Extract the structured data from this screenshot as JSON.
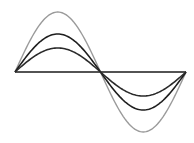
{
  "diagram": {
    "axis": {
      "x_start": 15,
      "x_end": 186,
      "y": 72,
      "color": "#1a1a1a"
    },
    "waves": [
      {
        "name": "large",
        "amplitude": 60,
        "color": "#9a9a9a",
        "width": 1.4
      },
      {
        "name": "medium",
        "amplitude": 38,
        "color": "#1e1e1e",
        "width": 1.6
      },
      {
        "name": "small",
        "amplitude": 24,
        "color": "#2a2a2a",
        "width": 1.6
      }
    ]
  }
}
